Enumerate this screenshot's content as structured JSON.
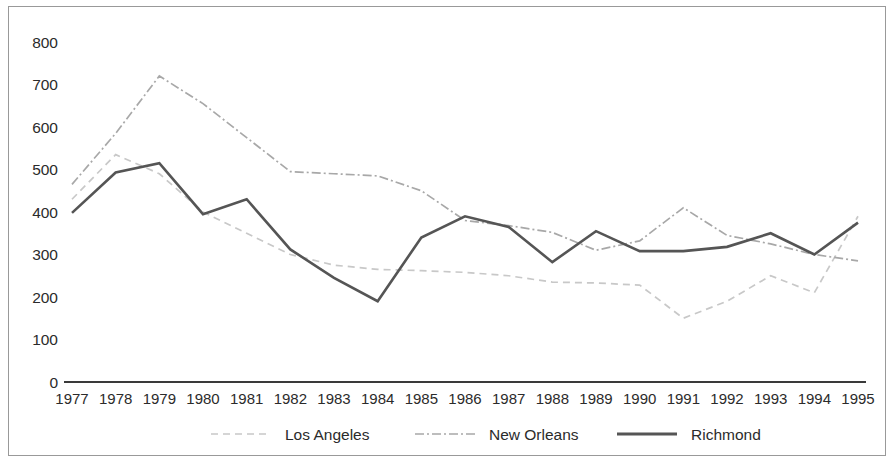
{
  "chart_data": {
    "type": "line",
    "title": "",
    "subtitle": "",
    "xlabel": "",
    "ylabel": "",
    "categories": [
      "1977",
      "1978",
      "1979",
      "1980",
      "1981",
      "1982",
      "1983",
      "1984",
      "1985",
      "1986",
      "1987",
      "1988",
      "1989",
      "1990",
      "1991",
      "1992",
      "1993",
      "1994",
      "1995"
    ],
    "x": [
      1977,
      1978,
      1979,
      1980,
      1981,
      1982,
      1983,
      1984,
      1985,
      1986,
      1987,
      1988,
      1989,
      1990,
      1991,
      1992,
      1993,
      1994,
      1995
    ],
    "ylim": [
      0,
      800
    ],
    "yticks": [
      0,
      100,
      200,
      300,
      400,
      500,
      600,
      700,
      800
    ],
    "ytick_labels": [
      "0",
      "100",
      "200",
      "300",
      "400",
      "500",
      "600",
      "700",
      "800"
    ],
    "grid": false,
    "legend_position": "bottom",
    "series": [
      {
        "name": "Los Angeles",
        "style": "dashed",
        "color": "#c8c8c8",
        "values": [
          430,
          535,
          490,
          400,
          350,
          300,
          275,
          265,
          262,
          258,
          250,
          235,
          233,
          228,
          150,
          190,
          250,
          210,
          390
        ]
      },
      {
        "name": "New Orleans",
        "style": "dash-dot",
        "color": "#a8a8a8",
        "values": [
          465,
          585,
          720,
          655,
          575,
          495,
          490,
          485,
          450,
          380,
          368,
          352,
          310,
          332,
          410,
          345,
          325,
          300,
          285
        ]
      },
      {
        "name": "Richmond",
        "style": "solid",
        "color": "#555555",
        "values": [
          398,
          493,
          515,
          395,
          430,
          312,
          245,
          190,
          340,
          390,
          365,
          282,
          355,
          308,
          308,
          318,
          350,
          300,
          375
        ]
      }
    ]
  },
  "legend": {
    "items": [
      {
        "label": "Los Angeles"
      },
      {
        "label": "New Orleans"
      },
      {
        "label": "Richmond"
      }
    ]
  }
}
